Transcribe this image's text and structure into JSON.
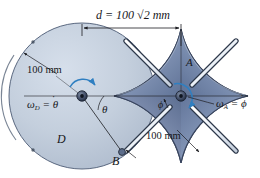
{
  "figure": {
    "background_color": "#ffffff",
    "colors": {
      "disk_fill": "#c2cddc",
      "disk_edge": "#5d6b80",
      "star_fill": "#8a9cbb",
      "star_fill_dark": "#6a7d9e",
      "star_edge": "#3e4c66",
      "slot_white": "#f2f5f9",
      "arrow_blue": "#2f7fc1",
      "line_black": "#1c1d21",
      "hub_dark": "#2b3444"
    }
  },
  "dimensions": {
    "center_distance_label": "d = 100 √2 mm",
    "center_distance_prefix": "d",
    "center_distance_value": "= 100 √2 mm",
    "disk_radius_label": "100 mm",
    "star_radius_label": "100 mm"
  },
  "labels": {
    "disk_name": "D",
    "star_name": "A",
    "pin_name": "B",
    "angle_theta": "θ",
    "angle_phi": "ϕ",
    "omega_disk_symbol": "ω",
    "omega_disk_sub": "D",
    "omega_disk_value": "= θ",
    "omega_star_symbol": "ω",
    "omega_star_sub": "A",
    "omega_star_value": "= ϕ",
    "dot_accent": "˙",
    "omega_disk_full": "ωD = θ̇",
    "omega_star_full": "ωA = ϕ̇"
  },
  "geometry": {
    "disk_center": [
      82,
      96
    ],
    "disk_radius": 73,
    "star_center": [
      181,
      96
    ],
    "star_radius": 67,
    "dimension_line_y": 28,
    "dimension_line_x1": 82,
    "dimension_line_x2": 181,
    "pin_position": [
      120,
      152
    ],
    "theta_angle_degrees": 45,
    "slot_count": 4
  }
}
